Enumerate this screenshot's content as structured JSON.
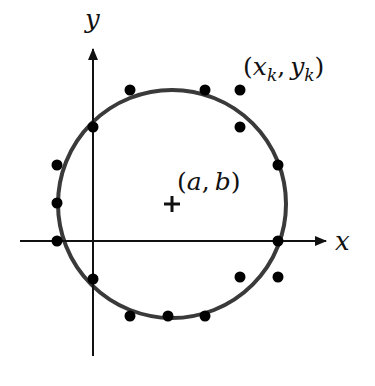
{
  "diagram": {
    "colors": {
      "background": "#ffffff",
      "axes": "#111111",
      "circle": "#3a3a3a",
      "points": "#000000"
    },
    "axes": {
      "x_label": "x",
      "y_label": "y",
      "origin_px": [
        93,
        241
      ]
    },
    "circle": {
      "center_px": [
        172,
        204
      ],
      "radius_px": 114,
      "center_marker": "+",
      "center_label": {
        "open": "(",
        "a": "a",
        "comma": ",",
        "b": "b",
        "close": ")"
      }
    },
    "point_label": {
      "open": "(",
      "x": "x",
      "x_sub": "k",
      "comma": ",",
      "y": "y",
      "y_sub": "k",
      "close": ")"
    },
    "points_px": [
      [
        130,
        90
      ],
      [
        205,
        90
      ],
      [
        240,
        90
      ],
      [
        93,
        127
      ],
      [
        240,
        127
      ],
      [
        57,
        165
      ],
      [
        278,
        165
      ],
      [
        57,
        203
      ],
      [
        57,
        241
      ],
      [
        278,
        241
      ],
      [
        93,
        279
      ],
      [
        240,
        277
      ],
      [
        278,
        277
      ],
      [
        130,
        316
      ],
      [
        168,
        316
      ],
      [
        205,
        316
      ]
    ]
  }
}
